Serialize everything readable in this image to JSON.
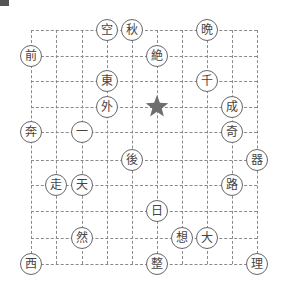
{
  "grid": {
    "cols": 10,
    "rows": 10,
    "x": [
      31,
      56,
      82,
      107,
      132,
      157,
      182,
      207,
      232,
      257
    ],
    "y": [
      30,
      56,
      81,
      107,
      132,
      160,
      185,
      211,
      238,
      264
    ],
    "line_color": "#8a8a8a"
  },
  "marker": {
    "icon": "star-icon",
    "col": 5,
    "row": 3,
    "color": "#6e6e6e"
  },
  "tiles": [
    {
      "char": "空",
      "col": 3,
      "row": 0
    },
    {
      "char": "秋",
      "col": 4,
      "row": 0
    },
    {
      "char": "晩",
      "col": 7,
      "row": 0
    },
    {
      "char": "前",
      "col": 0,
      "row": 1
    },
    {
      "char": "絶",
      "col": 5,
      "row": 1
    },
    {
      "char": "東",
      "col": 3,
      "row": 2
    },
    {
      "char": "千",
      "col": 7,
      "row": 2
    },
    {
      "char": "外",
      "col": 3,
      "row": 3
    },
    {
      "char": "成",
      "col": 8,
      "row": 3
    },
    {
      "char": "奔",
      "col": 0,
      "row": 4
    },
    {
      "char": "一",
      "col": 2,
      "row": 4
    },
    {
      "char": "奇",
      "col": 8,
      "row": 4
    },
    {
      "char": "後",
      "col": 4,
      "row": 5
    },
    {
      "char": "器",
      "col": 9,
      "row": 5
    },
    {
      "char": "走",
      "col": 1,
      "row": 6
    },
    {
      "char": "天",
      "col": 2,
      "row": 6
    },
    {
      "char": "路",
      "col": 8,
      "row": 6
    },
    {
      "char": "日",
      "col": 5,
      "row": 7
    },
    {
      "char": "然",
      "col": 2,
      "row": 8
    },
    {
      "char": "想",
      "col": 6,
      "row": 8
    },
    {
      "char": "大",
      "col": 7,
      "row": 8
    },
    {
      "char": "西",
      "col": 0,
      "row": 9
    },
    {
      "char": "整",
      "col": 5,
      "row": 9
    },
    {
      "char": "理",
      "col": 9,
      "row": 9
    }
  ]
}
